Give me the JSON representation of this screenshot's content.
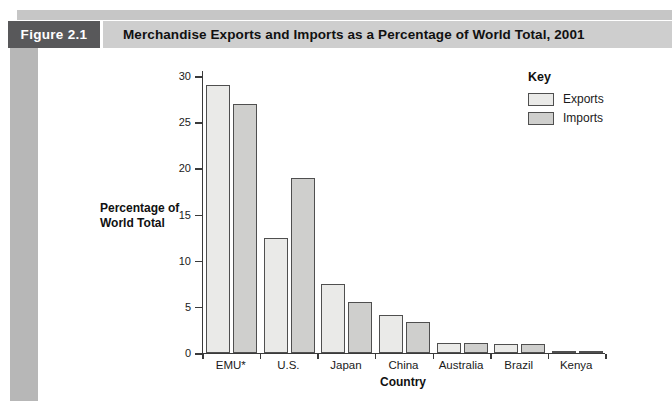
{
  "header": {
    "figure_label": "Figure 2.1",
    "title": "Merchandise Exports and Imports as a Percentage of World Total, 2001"
  },
  "chart": {
    "ylabel_line1": "Percentage of",
    "ylabel_line2": "World Total",
    "xlabel": "Country",
    "legend_title": "Key"
  },
  "chart_data": {
    "type": "bar",
    "title": "Merchandise Exports and Imports as a Percentage of World Total, 2001",
    "categories": [
      "EMU*",
      "U.S.",
      "Japan",
      "China",
      "Australia",
      "Brazil",
      "Kenya"
    ],
    "series": [
      {
        "name": "Exports",
        "values": [
          29,
          12.5,
          7.5,
          4.1,
          1.1,
          1.0,
          0.2
        ]
      },
      {
        "name": "Imports",
        "values": [
          27,
          19,
          5.5,
          3.4,
          1.1,
          1.0,
          0.2
        ]
      }
    ],
    "xlabel": "Country",
    "ylabel": "Percentage of World Total",
    "ylim": [
      0,
      30
    ],
    "yticks": [
      0,
      5,
      10,
      15,
      20,
      25,
      30
    ],
    "grid": false,
    "legend_position": "upper right"
  },
  "colors": {
    "exports_fill": "#eaeae8",
    "imports_fill": "#cfcfcd",
    "bar_border": "#4f4f4f",
    "axis": "#3a3a3a",
    "figure_box_bg": "#58585a",
    "figure_box_text": "#ffffff",
    "title_bar_bg": "#cecece",
    "top_bar_bg": "#c6c6c6",
    "left_strip_bg": "#b7b7b7"
  }
}
